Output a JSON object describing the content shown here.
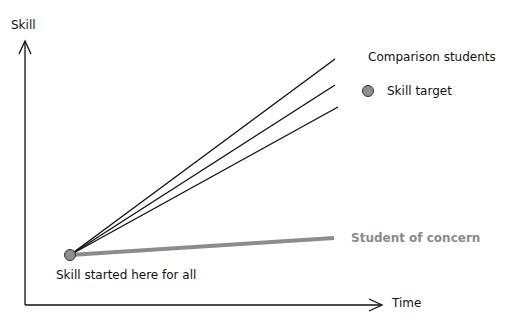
{
  "diagram": {
    "y_axis_label": "Skill",
    "x_axis_label": "Time",
    "start_label": "Skill started here for all",
    "comparison_label": "Comparison students",
    "target_label": "Skill target",
    "concern_label": "Student of concern"
  },
  "colors": {
    "axis": "#111111",
    "comparison_lines": "#111111",
    "concern_line": "#8c8c8c",
    "dot_fill": "#8f8f8f",
    "dot_stroke": "#333333",
    "concern_text": "#8a8a8a"
  },
  "geometry": {
    "origin": [
      25,
      305
    ],
    "y_axis_top": [
      25,
      40
    ],
    "x_axis_end": [
      382,
      305
    ],
    "start_point": [
      70,
      255
    ],
    "comparison_ends": [
      [
        335,
        59
      ],
      [
        335,
        85
      ],
      [
        338,
        107
      ]
    ],
    "concern_end": [
      334,
      238
    ],
    "target_dot": [
      368,
      91
    ]
  }
}
